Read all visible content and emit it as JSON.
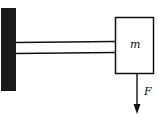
{
  "diagram": {
    "labels": {
      "mass": "m",
      "force": "F"
    },
    "colors": {
      "ink": "#111111",
      "wall": "#1a1a1a",
      "background": "#ffffff"
    }
  }
}
